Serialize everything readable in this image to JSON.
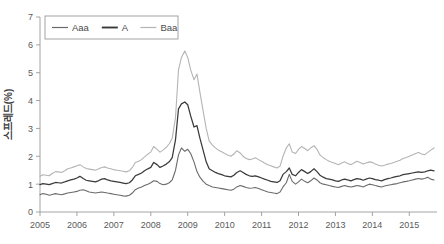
{
  "chart_data": {
    "type": "line",
    "title": "",
    "xlabel": "",
    "ylabel": "스프레드(%)",
    "ylim": [
      0,
      7
    ],
    "xlim": [
      2005.0,
      2015.75
    ],
    "yticks": [
      "0",
      "1",
      "2",
      "3",
      "4",
      "5",
      "6",
      "7"
    ],
    "ytick_values": [
      0,
      1,
      2,
      3,
      4,
      5,
      6,
      7
    ],
    "xticks": [
      "2005",
      "2006",
      "2007",
      "2008",
      "2009",
      "2010",
      "2011",
      "2012",
      "2013",
      "2014",
      "2015"
    ],
    "xtick_values": [
      2005,
      2006,
      2007,
      2008,
      2009,
      2010,
      2011,
      2012,
      2013,
      2014,
      2015
    ],
    "grid": false,
    "legend_position": "upper-left",
    "x": [
      2005.0,
      2005.08,
      2005.17,
      2005.25,
      2005.33,
      2005.42,
      2005.5,
      2005.58,
      2005.67,
      2005.75,
      2005.83,
      2005.92,
      2006.0,
      2006.08,
      2006.17,
      2006.25,
      2006.33,
      2006.42,
      2006.5,
      2006.58,
      2006.67,
      2006.75,
      2006.83,
      2006.92,
      2007.0,
      2007.08,
      2007.17,
      2007.25,
      2007.33,
      2007.42,
      2007.5,
      2007.58,
      2007.67,
      2007.75,
      2007.83,
      2007.92,
      2008.0,
      2008.08,
      2008.17,
      2008.25,
      2008.33,
      2008.42,
      2008.5,
      2008.58,
      2008.67,
      2008.75,
      2008.83,
      2008.92,
      2009.0,
      2009.08,
      2009.17,
      2009.25,
      2009.33,
      2009.42,
      2009.5,
      2009.58,
      2009.67,
      2009.75,
      2009.83,
      2009.92,
      2010.0,
      2010.08,
      2010.17,
      2010.25,
      2010.33,
      2010.42,
      2010.5,
      2010.58,
      2010.67,
      2010.75,
      2010.83,
      2010.92,
      2011.0,
      2011.08,
      2011.17,
      2011.25,
      2011.33,
      2011.42,
      2011.5,
      2011.58,
      2011.67,
      2011.75,
      2011.83,
      2011.92,
      2012.0,
      2012.08,
      2012.17,
      2012.25,
      2012.33,
      2012.42,
      2012.5,
      2012.58,
      2012.67,
      2012.75,
      2012.83,
      2012.92,
      2013.0,
      2013.08,
      2013.17,
      2013.25,
      2013.33,
      2013.42,
      2013.5,
      2013.58,
      2013.67,
      2013.75,
      2013.83,
      2013.92,
      2014.0,
      2014.08,
      2014.17,
      2014.25,
      2014.33,
      2014.42,
      2014.5,
      2014.58,
      2014.67,
      2014.75,
      2014.83,
      2014.92,
      2015.0,
      2015.08,
      2015.17,
      2015.25,
      2015.33,
      2015.42,
      2015.5,
      2015.58,
      2015.67
    ],
    "series": [
      {
        "name": "Aaa",
        "color": "#6b6b6b",
        "width": 1.1,
        "values": [
          0.62,
          0.66,
          0.64,
          0.6,
          0.63,
          0.66,
          0.64,
          0.62,
          0.65,
          0.68,
          0.7,
          0.72,
          0.74,
          0.78,
          0.8,
          0.76,
          0.72,
          0.7,
          0.68,
          0.7,
          0.72,
          0.7,
          0.68,
          0.66,
          0.64,
          0.62,
          0.6,
          0.58,
          0.57,
          0.6,
          0.68,
          0.8,
          0.86,
          0.9,
          0.95,
          1.0,
          1.05,
          1.12,
          1.1,
          1.02,
          0.98,
          1.0,
          1.05,
          1.15,
          1.5,
          2.05,
          2.3,
          2.18,
          2.25,
          2.1,
          1.8,
          1.45,
          1.25,
          1.1,
          1.0,
          0.95,
          0.9,
          0.88,
          0.86,
          0.84,
          0.82,
          0.8,
          0.78,
          0.82,
          0.9,
          0.95,
          0.92,
          0.88,
          0.85,
          0.86,
          0.88,
          0.84,
          0.8,
          0.76,
          0.72,
          0.7,
          0.68,
          0.66,
          0.72,
          0.9,
          1.05,
          1.35,
          1.1,
          1.0,
          1.08,
          1.18,
          1.1,
          1.05,
          1.12,
          1.22,
          1.15,
          1.05,
          1.0,
          0.98,
          0.95,
          0.92,
          0.9,
          0.88,
          0.92,
          0.95,
          0.92,
          0.9,
          0.92,
          0.95,
          0.93,
          0.9,
          0.95,
          1.0,
          0.98,
          0.95,
          0.92,
          0.9,
          0.93,
          0.96,
          0.98,
          1.0,
          1.02,
          1.05,
          1.08,
          1.1,
          1.12,
          1.15,
          1.18,
          1.2,
          1.18,
          1.2,
          1.25,
          1.18,
          1.15
        ]
      },
      {
        "name": "A",
        "color": "#3a3a3a",
        "width": 1.25,
        "values": [
          0.98,
          1.02,
          1.0,
          0.98,
          1.02,
          1.06,
          1.05,
          1.04,
          1.08,
          1.12,
          1.15,
          1.18,
          1.22,
          1.28,
          1.2,
          1.14,
          1.12,
          1.1,
          1.08,
          1.12,
          1.18,
          1.2,
          1.15,
          1.12,
          1.1,
          1.08,
          1.06,
          1.04,
          1.02,
          1.05,
          1.15,
          1.3,
          1.35,
          1.4,
          1.48,
          1.55,
          1.6,
          1.78,
          1.7,
          1.6,
          1.65,
          1.72,
          1.8,
          1.95,
          2.6,
          3.7,
          3.88,
          3.95,
          3.85,
          3.45,
          3.05,
          3.1,
          2.65,
          2.2,
          1.8,
          1.55,
          1.48,
          1.42,
          1.38,
          1.34,
          1.3,
          1.28,
          1.26,
          1.32,
          1.42,
          1.48,
          1.42,
          1.35,
          1.3,
          1.28,
          1.3,
          1.26,
          1.22,
          1.18,
          1.14,
          1.1,
          1.08,
          1.06,
          1.12,
          1.35,
          1.45,
          1.58,
          1.35,
          1.3,
          1.42,
          1.52,
          1.45,
          1.38,
          1.45,
          1.55,
          1.45,
          1.32,
          1.25,
          1.2,
          1.18,
          1.15,
          1.12,
          1.1,
          1.15,
          1.18,
          1.15,
          1.12,
          1.16,
          1.2,
          1.18,
          1.14,
          1.18,
          1.22,
          1.2,
          1.16,
          1.14,
          1.12,
          1.16,
          1.2,
          1.22,
          1.25,
          1.28,
          1.3,
          1.34,
          1.36,
          1.38,
          1.4,
          1.42,
          1.44,
          1.42,
          1.44,
          1.48,
          1.5,
          1.48
        ]
      },
      {
        "name": "Baa",
        "color": "#b4b4b4",
        "width": 1.1,
        "values": [
          1.28,
          1.34,
          1.32,
          1.3,
          1.38,
          1.45,
          1.44,
          1.42,
          1.48,
          1.55,
          1.58,
          1.62,
          1.66,
          1.7,
          1.62,
          1.56,
          1.54,
          1.52,
          1.5,
          1.54,
          1.6,
          1.62,
          1.58,
          1.55,
          1.52,
          1.5,
          1.48,
          1.46,
          1.44,
          1.48,
          1.6,
          1.78,
          1.82,
          1.88,
          1.98,
          2.08,
          2.15,
          2.35,
          2.25,
          2.15,
          2.22,
          2.32,
          2.45,
          2.65,
          3.4,
          5.1,
          5.55,
          5.78,
          5.55,
          5.1,
          4.75,
          4.95,
          4.3,
          3.6,
          3.0,
          2.55,
          2.4,
          2.3,
          2.22,
          2.16,
          2.1,
          2.05,
          2.0,
          2.08,
          2.2,
          2.12,
          2.0,
          1.92,
          1.88,
          1.9,
          1.95,
          1.88,
          1.82,
          1.76,
          1.7,
          1.66,
          1.62,
          1.58,
          1.65,
          2.0,
          2.3,
          2.45,
          2.15,
          2.1,
          2.25,
          2.35,
          2.28,
          2.2,
          2.3,
          2.38,
          2.25,
          2.05,
          1.95,
          1.88,
          1.82,
          1.78,
          1.74,
          1.7,
          1.76,
          1.8,
          1.74,
          1.7,
          1.76,
          1.82,
          1.78,
          1.72,
          1.76,
          1.8,
          1.78,
          1.72,
          1.68,
          1.65,
          1.68,
          1.72,
          1.74,
          1.78,
          1.82,
          1.86,
          1.92,
          1.96,
          2.0,
          2.05,
          2.1,
          2.14,
          2.08,
          2.06,
          2.14,
          2.22,
          2.3
        ]
      }
    ],
    "legend": [
      {
        "label": "Aaa",
        "color": "#6b6b6b"
      },
      {
        "label": "A",
        "color": "#3a3a3a"
      },
      {
        "label": "Baa",
        "color": "#b4b4b4"
      }
    ]
  }
}
